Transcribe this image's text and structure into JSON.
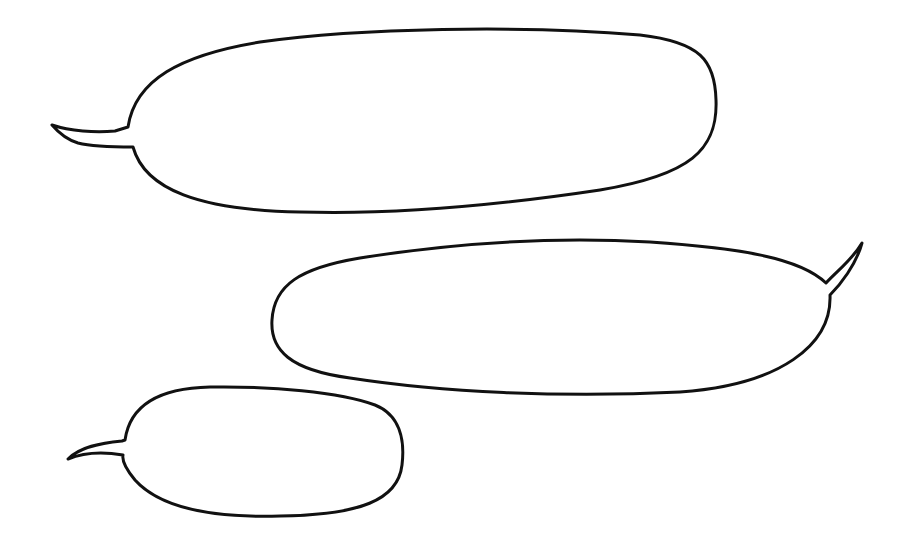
{
  "canvas": {
    "width": 912,
    "height": 548,
    "background": "#ffffff"
  },
  "bubbles": [
    {
      "id": "top",
      "text": "",
      "tail": "left"
    },
    {
      "id": "middle",
      "text": "",
      "tail": "right"
    },
    {
      "id": "bottom",
      "text": "",
      "tail": "left"
    }
  ],
  "colors": {
    "stroke": "#111111",
    "fill": "#ffffff"
  }
}
